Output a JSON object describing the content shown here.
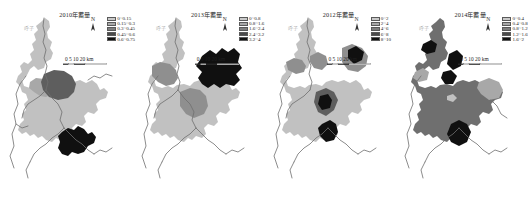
{
  "figure": {
    "background_color": "#ffffff",
    "panel_count": 4
  },
  "panels": [
    {
      "title": "2010年蓄量",
      "north_label": "N",
      "corner_label": "呼子",
      "scale": {
        "labels": "0 5 10   20 km",
        "units": "km"
      },
      "legend": [
        {
          "label": "0~0.15",
          "color": "#c9c9c9"
        },
        {
          "label": "0.15~0.3",
          "color": "#a8a8a8"
        },
        {
          "label": "0.3~0.45",
          "color": "#7d7d7d"
        },
        {
          "label": "0.45~0.6",
          "color": "#4a4a4a"
        },
        {
          "label": "0.6~0.75",
          "color": "#121212"
        }
      ]
    },
    {
      "title": "2013年蓄量",
      "north_label": "N",
      "corner_label": "呼子",
      "scale": {
        "labels": "0 5 10   20 km",
        "units": "km"
      },
      "legend": [
        {
          "label": "0~0.8",
          "color": "#c9c9c9"
        },
        {
          "label": "0.8~1.6",
          "color": "#a8a8a8"
        },
        {
          "label": "1.6~2.4",
          "color": "#7d7d7d"
        },
        {
          "label": "2.4~3.2",
          "color": "#4a4a4a"
        },
        {
          "label": "3.2~4",
          "color": "#121212"
        }
      ]
    },
    {
      "title": "2012年蓄量",
      "north_label": "N",
      "corner_label": "呼子",
      "scale": {
        "labels": "0 5 10   20 km",
        "units": "km"
      },
      "legend": [
        {
          "label": "0~2",
          "color": "#c9c9c9"
        },
        {
          "label": "2~4",
          "color": "#a8a8a8"
        },
        {
          "label": "4~6",
          "color": "#7d7d7d"
        },
        {
          "label": "6~8",
          "color": "#4a4a4a"
        },
        {
          "label": "8~10",
          "color": "#121212"
        }
      ]
    },
    {
      "title": "2014年蓄量",
      "north_label": "N",
      "corner_label": "呼子",
      "scale": {
        "labels": "0 5 10   20 km",
        "units": "km"
      },
      "legend": [
        {
          "label": "0~0.4",
          "color": "#c9c9c9"
        },
        {
          "label": "0.4~0.8",
          "color": "#a8a8a8"
        },
        {
          "label": "0.8~1.2",
          "color": "#7d7d7d"
        },
        {
          "label": "1.2~1.6",
          "color": "#4a4a4a"
        },
        {
          "label": "1.6~2",
          "color": "#121212"
        }
      ]
    }
  ],
  "map_colors": {
    "class_1": "#c9c9c9",
    "class_2": "#a8a8a8",
    "class_3": "#7d7d7d",
    "class_4": "#4a4a4a",
    "class_5": "#121212",
    "river": "#6e6e6e",
    "outline": "#9a9a9a"
  }
}
